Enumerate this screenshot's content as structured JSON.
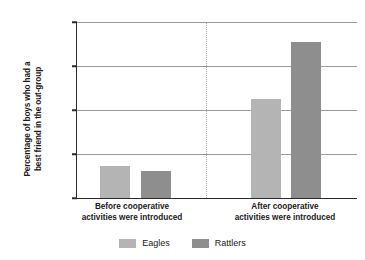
{
  "chart_data": {
    "type": "bar",
    "title": "",
    "xlabel": "",
    "ylabel_line1": "Percentage of boys who had a",
    "ylabel_line2": "best friend in the out-group",
    "categories": [
      {
        "line1": "Before cooperative",
        "line2": "activities were introduced"
      },
      {
        "line1": "After cooperative",
        "line2": "activities were introduced"
      }
    ],
    "series": [
      {
        "name": "Eagles",
        "color": "#b4b4b4",
        "values": [
          7.3,
          22.5
        ]
      },
      {
        "name": "Rattlers",
        "color": "#8e8e8e",
        "values": [
          6.2,
          35.5
        ]
      }
    ],
    "ylim": [
      0,
      40
    ],
    "yticks": [
      0,
      10,
      20,
      30,
      40
    ],
    "ytick_labels": [
      "0",
      "10",
      "20",
      "30",
      "40"
    ],
    "grid": true,
    "grid_color": "#9a9a9a",
    "axis_color": "#2b2b2b",
    "legend_position": "bottom-center",
    "group_divider": true,
    "group_divider_color": "#b0a8a8"
  }
}
